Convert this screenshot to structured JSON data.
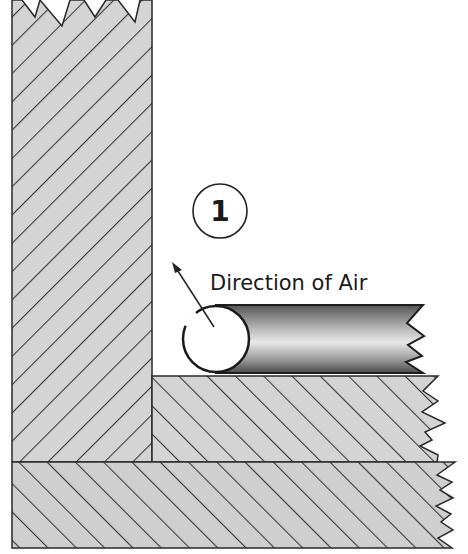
{
  "diagram": {
    "step_number": "1",
    "annotation": "Direction of Air",
    "components": [
      {
        "id": "vertical-board",
        "description": "Vertical wall material (hatched)"
      },
      {
        "id": "horizontal-board",
        "description": "Horizontal material (hatched)"
      },
      {
        "id": "base-board",
        "description": "Base substrate (hatched)"
      },
      {
        "id": "backer-rod",
        "description": "Cylindrical backer rod placed in the corner joint"
      }
    ],
    "colors": {
      "fill": "#d4d4d4",
      "hatch": "#3a3a3a",
      "outline": "#2a2a2a",
      "rod_dark": "#4a4a4a",
      "rod_light": "#e6e6e6",
      "background": "#ffffff"
    }
  }
}
